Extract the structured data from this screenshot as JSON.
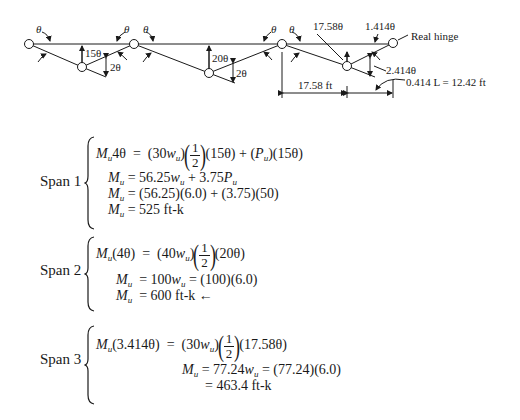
{
  "diagram": {
    "labels": {
      "theta": "θ",
      "span1_deflection": "15θ",
      "span1_rotation": "2θ",
      "span2_deflection": "20θ",
      "span2_rotation": "2θ",
      "span3_deflection": "17.58θ",
      "span3_left_rotation": "1.414θ",
      "span3_right_rotation": "2.414θ",
      "real_hinge": "Real hinge",
      "dim_left": "17.58 ft",
      "dim_right": "0.414 L = 12.42 ft"
    }
  },
  "spans": [
    {
      "label": "Span 1",
      "equations": [
        {
          "lhs": "M_u 4θ",
          "rhs": "(30w_u)(1/2)(15θ) + (P_u)(15θ)"
        },
        {
          "lhs": "M_u",
          "rhs": "56.25w_u + 3.75P_u"
        },
        {
          "lhs": "M_u",
          "rhs": "(56.25)(6.0) + (3.75)(50)"
        },
        {
          "lhs": "M_u",
          "rhs": "525 ft-k"
        }
      ],
      "parts": {
        "l1_pre": "(30",
        "l1_mid": ")",
        "l1_post": "(15θ) + (",
        "l1_end": ")(15θ)",
        "l2": "56.25",
        "l2b": " + 3.75",
        "l3": "(56.25)(6.0) + (3.75)(50)",
        "l4": "525 ft-k"
      }
    },
    {
      "label": "Span 2",
      "equations": [
        {
          "lhs": "M_u(4θ)",
          "rhs": "(40w_u)(1/2)(20θ)"
        },
        {
          "lhs": "M_u",
          "rhs": "100w_u = (100)(6.0)"
        },
        {
          "lhs": "M_u",
          "rhs": "600 ft-k ←"
        }
      ],
      "parts": {
        "l1_lhs": "(4θ)",
        "l1_pre": "(40",
        "l1_mid": ")",
        "l1_post": "(20θ)",
        "l2": "100",
        "l2b": " = (100)(6.0)",
        "l3": "600 ft-k ←"
      }
    },
    {
      "label": "Span 3",
      "equations": [
        {
          "lhs": "M_u(3.414θ)",
          "rhs": "(30w_u)(1/2)(17.58θ)"
        },
        {
          "lhs": "M_u",
          "rhs": "77.24w_u = (77.24)(6.0)"
        },
        {
          "lhs": "",
          "rhs": "= 463.4 ft-k"
        }
      ],
      "parts": {
        "l1_lhs": "(3.414θ)",
        "l1_pre": "(30",
        "l1_mid": ")",
        "l1_post": "(17.58θ)",
        "l2": "77.24",
        "l2b": " = (77.24)(6.0)",
        "l3": "= 463.4 ft-k"
      }
    }
  ],
  "symbols": {
    "M": "M",
    "u": "u",
    "w": "w",
    "P": "P",
    "eq": "=",
    "one": "1",
    "two": "2",
    "four_theta": "4θ"
  }
}
